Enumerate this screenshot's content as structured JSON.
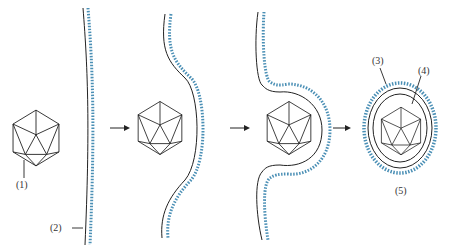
{
  "diagram": {
    "type": "virus-budding-sequence",
    "stages": 4,
    "labels": {
      "l1": "(1)",
      "l2": "(2)",
      "l3": "(3)",
      "l4": "(4)",
      "l5": "(5)"
    },
    "colors": {
      "line": "#222222",
      "protein_dots": "#4a8fb5",
      "protein_dark": "#2a4a5e"
    }
  }
}
